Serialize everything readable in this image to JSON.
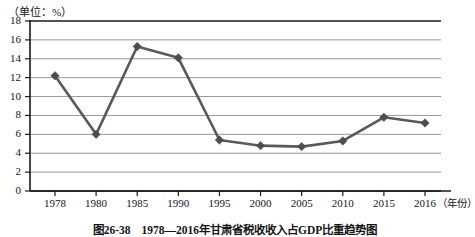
{
  "figure": {
    "unit_label": "（单位：%）",
    "xaxis_unit": "（年份）",
    "caption": "图26-38　1978—2016年甘肃省税收收入占GDP比重趋势图"
  },
  "style": {
    "line_color": "#595959",
    "marker_color": "#4d4d4d",
    "grid_color": "#8c8c8c",
    "axis_color": "#1a1a1a"
  },
  "chart_data": {
    "type": "line",
    "title": "图26-38　1978—2016年甘肃省税收收入占GDP比重趋势图",
    "xlabel": "（年份）",
    "ylabel": "（单位：%）",
    "categories": [
      "1978",
      "1980",
      "1985",
      "1990",
      "1995",
      "2000",
      "2005",
      "2010",
      "2015",
      "2016"
    ],
    "values": [
      12.2,
      6.0,
      15.3,
      14.1,
      5.4,
      4.8,
      4.7,
      5.3,
      7.8,
      7.2
    ],
    "yticks": [
      0,
      2,
      4,
      6,
      8,
      10,
      12,
      14,
      16,
      18
    ],
    "ylim": [
      0,
      18
    ],
    "grid": true,
    "legend": "none",
    "marker": "diamond"
  }
}
